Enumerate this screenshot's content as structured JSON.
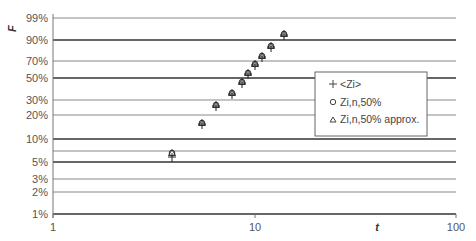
{
  "chart_data": {
    "type": "scatter",
    "title": "",
    "xlabel": "t",
    "ylabel": "F",
    "xscale": "log",
    "yscale": "probability (Weibull)",
    "xlim": [
      1,
      100
    ],
    "ylim": [
      "1%",
      "99%"
    ],
    "x_ticks": [
      "1",
      "10",
      "100"
    ],
    "y_ticks": [
      "99%",
      "90%",
      "70%",
      "50%",
      "30%",
      "20%",
      "10%",
      "5%",
      "3%",
      "2%",
      "1%"
    ],
    "grid": true,
    "legend_position": "right-center, boxed",
    "series": [
      {
        "name": "<Zi>",
        "marker": "plus",
        "x": [
          3.9,
          5.5,
          6.4,
          7.7,
          8.7,
          9.3,
          10.0,
          10.9,
          12.1,
          14.0
        ],
        "y": [
          5.5,
          16,
          26,
          36,
          46,
          56,
          66,
          75,
          84,
          94
        ]
      },
      {
        "name": "Zi,n,50%",
        "marker": "circle",
        "x": [
          3.9,
          5.5,
          6.4,
          7.7,
          8.7,
          9.3,
          10.0,
          10.9,
          12.1,
          14.0
        ],
        "y": [
          6.7,
          16.2,
          25.9,
          35.5,
          45.2,
          54.8,
          64.5,
          74.1,
          83.8,
          93.3
        ]
      },
      {
        "name": "Zi,n,50% approx.",
        "marker": "triangle",
        "x": [
          3.9,
          5.5,
          6.4,
          7.7,
          8.7,
          9.3,
          10.0,
          10.9,
          12.1,
          14.0
        ],
        "y": [
          6.7,
          16.3,
          26.0,
          35.6,
          45.2,
          54.8,
          64.4,
          74.0,
          83.7,
          93.3
        ]
      }
    ]
  },
  "axes": {
    "y_label": "F",
    "x_label": "t",
    "x_ticks": [
      {
        "label": "1",
        "value": 1
      },
      {
        "label": "10",
        "value": 10
      },
      {
        "label": "100",
        "value": 100
      }
    ],
    "y_ticks": [
      {
        "label": "99%",
        "y": 18,
        "bold": false
      },
      {
        "label": "90%",
        "y": 40,
        "bold": true
      },
      {
        "label": "70%",
        "y": 61,
        "bold": false
      },
      {
        "label": "50%",
        "y": 78,
        "bold": true
      },
      {
        "label": "30%",
        "y": 100,
        "bold": false
      },
      {
        "label": "20%",
        "y": 115,
        "bold": false
      },
      {
        "label": "10%",
        "y": 139,
        "bold": true
      },
      {
        "label": "",
        "y": 151,
        "bold": false
      },
      {
        "label": "5%",
        "y": 162,
        "bold": true
      },
      {
        "label": "3%",
        "y": 179,
        "bold": false
      },
      {
        "label": "2%",
        "y": 192,
        "bold": false
      },
      {
        "label": "1%",
        "y": 214,
        "bold": true
      }
    ]
  },
  "legend": {
    "items": [
      {
        "symbol": "+",
        "label": "<Zi>"
      },
      {
        "symbol": "○",
        "label": "Zi,n,50%"
      },
      {
        "symbol": "△",
        "label": "Zi,n,50% approx."
      }
    ]
  },
  "colors": {
    "line": "#333333",
    "light_line": "#888888",
    "text": "#555555"
  },
  "points_px": [
    {
      "x": 172,
      "y_circle": 153,
      "y_plus": 157
    },
    {
      "x": 202,
      "y_circle": 123,
      "y_plus": 124
    },
    {
      "x": 216,
      "y_circle": 105,
      "y_plus": 106
    },
    {
      "x": 232,
      "y_circle": 93,
      "y_plus": 94
    },
    {
      "x": 242,
      "y_circle": 82,
      "y_plus": 83
    },
    {
      "x": 248,
      "y_circle": 73,
      "y_plus": 74
    },
    {
      "x": 255,
      "y_circle": 64,
      "y_plus": 65
    },
    {
      "x": 262,
      "y_circle": 56,
      "y_plus": 57
    },
    {
      "x": 271,
      "y_circle": 46,
      "y_plus": 47
    },
    {
      "x": 284,
      "y_circle": 34,
      "y_plus": 35
    }
  ]
}
